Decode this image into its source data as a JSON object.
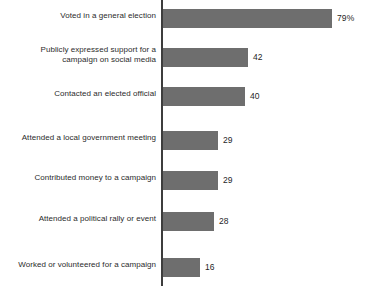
{
  "chart_data": {
    "type": "bar",
    "orientation": "horizontal",
    "title": "",
    "subtitle": "",
    "xlabel": "",
    "ylabel": "",
    "grid": false,
    "legend": null,
    "xlim": [
      0,
      79
    ],
    "unit": "percent",
    "bar_color": "#6e6e6e",
    "axis_color": "#3d3d3d",
    "label_color": "#2b2b2b",
    "value_color": "#1f1f1f",
    "categories": [
      "Voted in a general election",
      "Publicly expressed support for a\ncampaign on social media",
      "Contacted an elected official",
      "Attended a local government meeting",
      "Contributed money to a campaign",
      "Attended a political rally or event",
      "Worked or volunteered for a campaign"
    ],
    "values": [
      79,
      42,
      40,
      29,
      29,
      28,
      16
    ],
    "value_labels": [
      "79%",
      "42",
      "40",
      "29",
      "29",
      "28",
      "16"
    ]
  },
  "bars": [
    {
      "label": "Voted in a general election",
      "value": 79,
      "value_label": "79%",
      "top": 9,
      "bar_width": 169,
      "label_top": 11,
      "value_left": 337
    },
    {
      "label": "Publicly expressed support for a\ncampaign on social media",
      "value": 42,
      "value_label": "42",
      "top": 48,
      "bar_width": 85,
      "label_top": 45,
      "value_left": 253
    },
    {
      "label": "Contacted an elected official",
      "value": 40,
      "value_label": "40",
      "top": 87,
      "bar_width": 82,
      "label_top": 89,
      "value_left": 250
    },
    {
      "label": "Attended a local government meeting",
      "value": 29,
      "value_label": "29",
      "top": 131,
      "bar_width": 55,
      "label_top": 133,
      "value_left": 223
    },
    {
      "label": "Contributed money to a campaign",
      "value": 29,
      "value_label": "29",
      "top": 171,
      "bar_width": 55,
      "label_top": 173,
      "value_left": 223
    },
    {
      "label": "Attended a political rally or event",
      "value": 28,
      "value_label": "28",
      "top": 212,
      "bar_width": 51,
      "label_top": 214,
      "value_left": 219
    },
    {
      "label": "Worked or volunteered for a campaign",
      "value": 16,
      "value_label": "16",
      "top": 258,
      "bar_width": 37,
      "label_top": 260,
      "value_left": 205
    }
  ]
}
